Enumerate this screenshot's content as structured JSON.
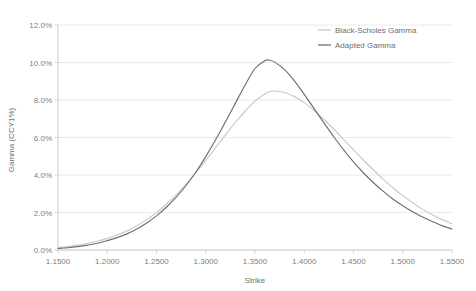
{
  "chart_data": {
    "type": "line",
    "title": "",
    "xlabel": "Strike",
    "ylabel": "Gamma (CCY1%)",
    "xlim": [
      1.15,
      1.55
    ],
    "ylim": [
      0.0,
      12.0
    ],
    "grid": true,
    "legend_position": "top-right",
    "x_tick_labels": [
      "1.1500",
      "1.2000",
      "1.2500",
      "1.3000",
      "1.3500",
      "1.4000",
      "1.4500",
      "1.5000",
      "1.5500"
    ],
    "x_ticks": [
      1.15,
      1.2,
      1.25,
      1.3,
      1.35,
      1.4,
      1.45,
      1.5,
      1.55
    ],
    "y_tick_labels": [
      "0.0%",
      "2.0%",
      "4.0%",
      "6.0%",
      "8.0%",
      "10.0%",
      "12.0%"
    ],
    "y_ticks": [
      0.0,
      2.0,
      4.0,
      6.0,
      8.0,
      10.0,
      12.0
    ],
    "x": [
      1.15,
      1.16,
      1.17,
      1.18,
      1.19,
      1.2,
      1.21,
      1.22,
      1.23,
      1.24,
      1.25,
      1.26,
      1.27,
      1.28,
      1.29,
      1.3,
      1.31,
      1.32,
      1.33,
      1.34,
      1.35,
      1.36,
      1.365,
      1.37,
      1.38,
      1.39,
      1.4,
      1.41,
      1.42,
      1.43,
      1.44,
      1.45,
      1.46,
      1.47,
      1.48,
      1.49,
      1.5,
      1.51,
      1.52,
      1.53,
      1.54,
      1.55
    ],
    "series": [
      {
        "name": "Black-Scholes Gamma",
        "color": "#c9c9c9",
        "values": [
          0.12,
          0.18,
          0.26,
          0.36,
          0.48,
          0.62,
          0.8,
          1.02,
          1.3,
          1.62,
          2.0,
          2.44,
          2.94,
          3.5,
          4.12,
          4.78,
          5.46,
          6.14,
          6.8,
          7.4,
          7.94,
          8.32,
          8.45,
          8.48,
          8.4,
          8.18,
          7.86,
          7.44,
          6.96,
          6.44,
          5.9,
          5.34,
          4.8,
          4.28,
          3.78,
          3.32,
          2.9,
          2.52,
          2.18,
          1.88,
          1.62,
          1.4
        ]
      },
      {
        "name": "Adapted Gamma",
        "color": "#6f6f6f",
        "values": [
          0.08,
          0.12,
          0.18,
          0.26,
          0.36,
          0.5,
          0.66,
          0.86,
          1.12,
          1.44,
          1.82,
          2.28,
          2.82,
          3.44,
          4.16,
          4.98,
          5.88,
          6.84,
          7.82,
          8.8,
          9.68,
          10.1,
          10.12,
          10.02,
          9.62,
          9.02,
          8.3,
          7.54,
          6.78,
          6.04,
          5.34,
          4.7,
          4.12,
          3.6,
          3.14,
          2.72,
          2.36,
          2.04,
          1.76,
          1.52,
          1.3,
          1.12
        ]
      }
    ],
    "legend": [
      {
        "label": "Black-Scholes Gamma",
        "color": "#c9c9c9"
      },
      {
        "label": "Adapted Gamma",
        "color": "#6f6f6f"
      }
    ]
  },
  "plot": {
    "left": 58,
    "right": 452,
    "top": 25,
    "bottom": 250
  }
}
